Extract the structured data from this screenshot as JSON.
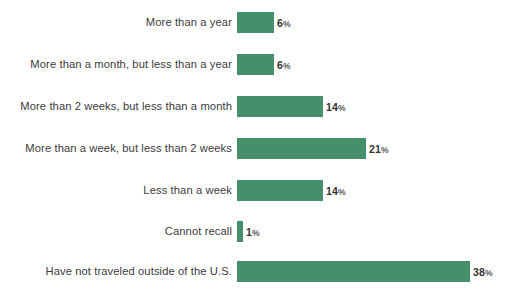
{
  "chart_data": {
    "type": "bar",
    "orientation": "horizontal",
    "title": "",
    "subtitle": "",
    "xlabel": "",
    "ylabel": "",
    "grid": false,
    "legend": null,
    "axis_line": false,
    "xlim": [
      0,
      38
    ],
    "value_suffix": "%",
    "bar_color": "#458f6b",
    "label_color": "#3b3b3b",
    "value_color": "#333333",
    "background_color": "#ffffff",
    "categories": [
      "More than a year",
      "More than a month, but less than a year",
      "More than 2 weeks, but less than a month",
      "More than a week, but less than 2 weeks",
      "Less than a week",
      "Cannot recall",
      "Have not traveled outside of the U.S."
    ],
    "values": [
      6,
      6,
      14,
      21,
      14,
      1,
      38
    ],
    "value_labels": [
      "6%",
      "6%",
      "14%",
      "21%",
      "14%",
      "1%",
      "38%"
    ],
    "bars": [
      {
        "label": "More than a year",
        "value": 6,
        "value_text": "6",
        "suffix": "%"
      },
      {
        "label": "More than a month, but less than a year",
        "value": 6,
        "value_text": "6",
        "suffix": "%"
      },
      {
        "label": "More than 2 weeks, but less than a month",
        "value": 14,
        "value_text": "14",
        "suffix": "%"
      },
      {
        "label": "More than a week, but less than 2 weeks",
        "value": 21,
        "value_text": "21",
        "suffix": "%"
      },
      {
        "label": "Less than a week",
        "value": 14,
        "value_text": "14",
        "suffix": "%"
      },
      {
        "label": "Cannot recall",
        "value": 1,
        "value_text": "1",
        "suffix": "%"
      },
      {
        "label": "Have not traveled outside of the U.S.",
        "value": 38,
        "value_text": "38",
        "suffix": "%"
      }
    ]
  }
}
